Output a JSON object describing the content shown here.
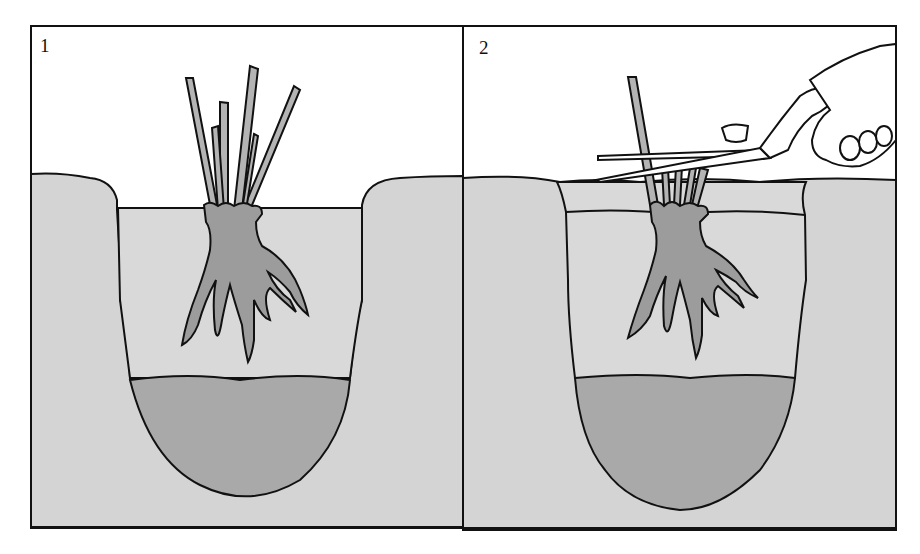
{
  "panels": [
    {
      "number": "1",
      "description": "Plant with leaves placed in hole on soil mound"
    },
    {
      "number": "2",
      "description": "Leaves trimmed with shears after backfilling"
    }
  ],
  "colors": {
    "soil": "#d4d4d4",
    "compost": "#a9a9a9",
    "plant": "#b4b4b4",
    "roots": "#9c9c9c",
    "outline": "#111111",
    "sky": "#ffffff"
  }
}
